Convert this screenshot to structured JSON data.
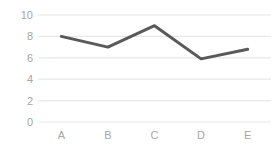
{
  "chart_data": {
    "type": "line",
    "title": "",
    "subtitle": "",
    "xlabel": "",
    "ylabel": "",
    "categories": [
      "A",
      "B",
      "C",
      "D",
      "E"
    ],
    "values": [
      8,
      7,
      9,
      5.9,
      6.8
    ],
    "series": [
      {
        "name": "Series 1",
        "values": [
          8,
          7,
          9,
          5.9,
          6.8
        ]
      }
    ],
    "ylim": [
      0,
      10
    ],
    "yticks": [
      0,
      2,
      4,
      6,
      8,
      10
    ],
    "ytick_labels": [
      "0",
      "2",
      "4",
      "6",
      "8",
      "10"
    ],
    "xtick_labels": [
      "A",
      "B",
      "C",
      "D",
      "E"
    ],
    "grid": true,
    "grid_axis": "y",
    "legend": false,
    "legend_position": "none",
    "markers": false,
    "annotations": []
  },
  "style": {
    "line_color": "#595959",
    "grid_color": "#e8e8e8",
    "tick_label_color": "#a6a6a6",
    "background_color": "#ffffff",
    "line_width": 3
  }
}
